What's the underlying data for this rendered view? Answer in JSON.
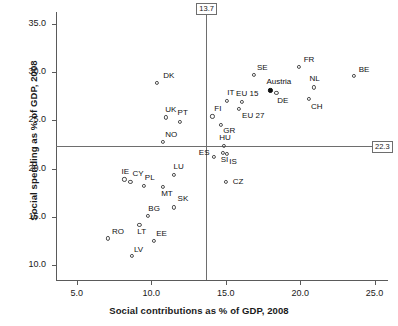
{
  "chart_data": {
    "type": "scatter",
    "title": "",
    "xlabel": "Social contributions as % of GDP, 2008",
    "ylabel": "Social spending as % of GDP, 2008",
    "xlim": [
      3.6,
      25.9
    ],
    "ylim": [
      8.5,
      36.2
    ],
    "xticks": [
      "5.0",
      "10.0",
      "15.0",
      "20.0",
      "25.0"
    ],
    "xtick_values": [
      5.0,
      10.0,
      15.0,
      20.0,
      25.0
    ],
    "yticks": [
      "10.0",
      "15.0",
      "20.0",
      "25.0",
      "30.0",
      "35.0"
    ],
    "ytick_values": [
      10.0,
      15.0,
      20.0,
      25.0,
      30.0,
      35.0
    ],
    "grid": false,
    "legend": null,
    "reference_lines": [
      {
        "name": "vertical-reference-line",
        "axis": "x",
        "value": 13.7,
        "label": "13.7"
      },
      {
        "name": "horizontal-reference-line",
        "axis": "y",
        "value": 22.3,
        "label": "22.3"
      }
    ],
    "points": [
      {
        "label": "DK",
        "x": 10.4,
        "y": 28.9,
        "filled": false,
        "lx": 6,
        "ly": -12
      },
      {
        "label": "UK",
        "x": 11.0,
        "y": 25.3,
        "filled": false,
        "lx": -1,
        "ly": -12
      },
      {
        "label": "PT",
        "x": 11.9,
        "y": 24.8,
        "filled": false,
        "lx": -2,
        "ly": -14
      },
      {
        "label": "NO",
        "x": 10.8,
        "y": 22.8,
        "filled": false,
        "lx": 2,
        "ly": -12
      },
      {
        "label": "SE",
        "x": 16.9,
        "y": 29.7,
        "filled": false,
        "lx": 3,
        "ly": -12
      },
      {
        "label": "FR",
        "x": 19.9,
        "y": 30.5,
        "filled": false,
        "lx": 5,
        "ly": -12
      },
      {
        "label": "BE",
        "x": 23.6,
        "y": 29.6,
        "filled": false,
        "lx": 5,
        "ly": -11
      },
      {
        "label": "NL",
        "x": 20.9,
        "y": 28.4,
        "filled": false,
        "lx": -4,
        "ly": -13
      },
      {
        "label": "Austria",
        "x": 18.0,
        "y": 28.1,
        "filled": true,
        "lx": -4,
        "ly": -13
      },
      {
        "label": "DE",
        "x": 18.4,
        "y": 27.8,
        "filled": false,
        "lx": 1,
        "ly": 3
      },
      {
        "label": "CH",
        "x": 20.6,
        "y": 27.2,
        "filled": false,
        "lx": 2,
        "ly": 3
      },
      {
        "label": "EU 15",
        "x": 16.1,
        "y": 26.9,
        "filled": false,
        "lx": -6,
        "ly": -13
      },
      {
        "label": "IT",
        "x": 15.1,
        "y": 27.0,
        "filled": false,
        "lx": 0,
        "ly": -13
      },
      {
        "label": "EU 27",
        "x": 15.9,
        "y": 26.2,
        "filled": false,
        "lx": 3,
        "ly": 2
      },
      {
        "label": "FI",
        "x": 14.1,
        "y": 25.4,
        "filled": false,
        "lx": 2,
        "ly": -12
      },
      {
        "label": "GR",
        "x": 14.7,
        "y": 24.5,
        "filled": false,
        "lx": 2,
        "ly": 1
      },
      {
        "label": "HU",
        "x": 14.9,
        "y": 22.4,
        "filled": false,
        "lx": -5,
        "ly": -13
      },
      {
        "label": "ES",
        "x": 14.2,
        "y": 21.2,
        "filled": false,
        "lx": -15,
        "ly": -9
      },
      {
        "label": "SI",
        "x": 14.8,
        "y": 21.6,
        "filled": false,
        "lx": -2,
        "ly": 2
      },
      {
        "label": "IS",
        "x": 15.1,
        "y": 21.5,
        "filled": false,
        "lx": 2,
        "ly": 3
      },
      {
        "label": "CZ",
        "x": 15.0,
        "y": 18.6,
        "filled": false,
        "lx": 7,
        "ly": -5
      },
      {
        "label": "LU",
        "x": 11.5,
        "y": 19.4,
        "filled": false,
        "lx": 0,
        "ly": -13
      },
      {
        "label": "IE",
        "x": 8.2,
        "y": 18.9,
        "filled": false,
        "lx": -3,
        "ly": -12
      },
      {
        "label": "CY",
        "x": 8.6,
        "y": 18.6,
        "filled": false,
        "lx": 2,
        "ly": -13
      },
      {
        "label": "PL",
        "x": 9.5,
        "y": 18.2,
        "filled": false,
        "lx": 1,
        "ly": -13
      },
      {
        "label": "MT",
        "x": 10.8,
        "y": 18.1,
        "filled": false,
        "lx": -2,
        "ly": 2
      },
      {
        "label": "SK",
        "x": 11.5,
        "y": 16.0,
        "filled": false,
        "lx": 4,
        "ly": -13
      },
      {
        "label": "BG",
        "x": 9.8,
        "y": 15.1,
        "filled": false,
        "lx": 0,
        "ly": -12
      },
      {
        "label": "RO",
        "x": 7.1,
        "y": 12.8,
        "filled": false,
        "lx": 4,
        "ly": -11
      },
      {
        "label": "LT",
        "x": 9.2,
        "y": 14.2,
        "filled": false,
        "lx": -2,
        "ly": 2
      },
      {
        "label": "EE",
        "x": 10.2,
        "y": 12.5,
        "filled": false,
        "lx": 2,
        "ly": -12
      },
      {
        "label": "LV",
        "x": 8.7,
        "y": 11.0,
        "filled": false,
        "lx": 2,
        "ly": -11
      }
    ]
  }
}
